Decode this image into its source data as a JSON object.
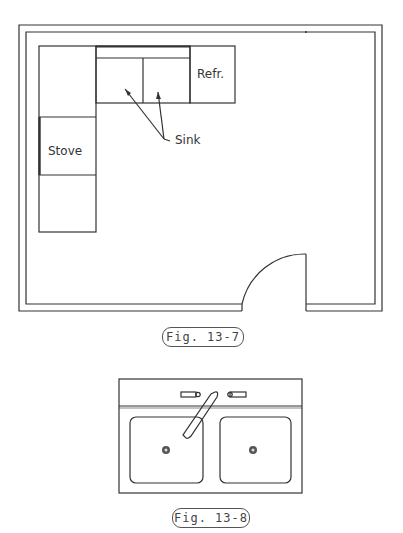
{
  "figures": [
    {
      "caption": "Fig. 13-7",
      "description": "Kitchen floor plan",
      "labels": {
        "stove": "Stove",
        "refrigerator": "Refr.",
        "sink": "Sink"
      }
    },
    {
      "caption": "Fig. 13-8",
      "description": "Double-bowl sink with faucet"
    }
  ],
  "colors": {
    "line": "#333333",
    "text": "#444444",
    "background": "#ffffff"
  }
}
